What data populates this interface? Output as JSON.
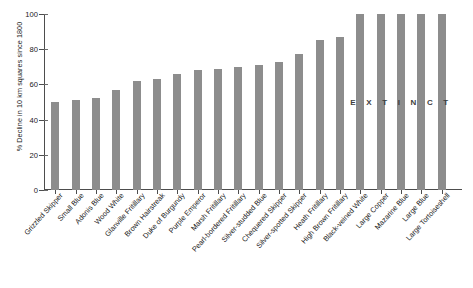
{
  "chart_data": {
    "type": "bar",
    "title": "",
    "xlabel": "",
    "ylabel": "% Decline in 10 km squares since 1800",
    "ylim": [
      0,
      100
    ],
    "yticks": [
      0,
      20,
      40,
      60,
      80,
      100
    ],
    "grid": false,
    "legend": null,
    "bar_color": "#8d8d8d",
    "categories": [
      "Grizzled Skipper",
      "Small Blue",
      "Adonis Blue",
      "Wood White",
      "Glanville Fritillary",
      "Brown Hairstreak",
      "Duke of Burgundy",
      "Purple Emperor",
      "Marsh Fritillary",
      "Pearl-bordered Fritillary",
      "Silver-studded Blue",
      "Chequered Skipper",
      "Silver-spotted Skipper",
      "Heath Fritillary",
      "High Brown Fritillary",
      "Black-veined White",
      "Large Copper",
      "Mazarine Blue",
      "Large Blue",
      "Large Tortoiseshell"
    ],
    "values": [
      50,
      51,
      52,
      57,
      62,
      63,
      66,
      68,
      69,
      70,
      71,
      73,
      77,
      85,
      87,
      100,
      100,
      100,
      100,
      100
    ],
    "annotations": [
      {
        "text": "E X T I N C T",
        "plain_text": "EXTINCT",
        "applies_to_categories": [
          "Black-veined White",
          "Large Copper",
          "Mazarine Blue",
          "Large Blue",
          "Large Tortoiseshell"
        ]
      }
    ]
  },
  "axis": {
    "y_title": "% Decline in 10 km squares since 1800",
    "y_tick_labels": [
      "0",
      "20",
      "40",
      "60",
      "80",
      "100"
    ]
  },
  "caption": {
    "text": ""
  }
}
